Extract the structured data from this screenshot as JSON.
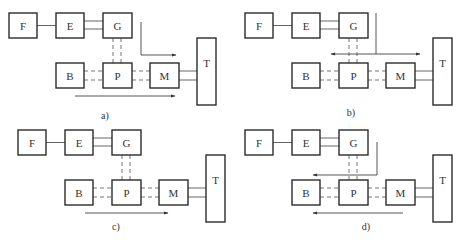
{
  "figure": {
    "colors": {
      "stroke": "#2b2b2b",
      "line": "#555555",
      "background": "#ffffff"
    },
    "components": [
      "F",
      "E",
      "G",
      "B",
      "P",
      "M",
      "T"
    ],
    "panels": [
      {
        "id": "a",
        "label": "a)",
        "offset": [
          0,
          0
        ],
        "label_pos": [
          105,
          119
        ],
        "flows": [
          {
            "points": [
              [
                141,
                22
              ],
              [
                141,
                55
              ],
              [
                176,
                55
              ]
            ],
            "heads": [
              "end"
            ]
          },
          {
            "points": [
              [
                75,
                96
              ],
              [
                175,
                96
              ]
            ],
            "heads": [
              "end"
            ]
          }
        ]
      },
      {
        "id": "b",
        "label": "b)",
        "offset": [
          236,
          0
        ],
        "label_pos": [
          351,
          116
        ],
        "flows": [
          {
            "points": [
              [
                376,
                13
              ],
              [
                376,
                54
              ]
            ],
            "heads": []
          },
          {
            "points": [
              [
                331,
                54
              ],
              [
                420,
                54
              ]
            ],
            "heads": [
              "start",
              "end"
            ]
          }
        ]
      },
      {
        "id": "c",
        "label": "c)",
        "offset": [
          9,
          117
        ],
        "label_pos": [
          116,
          230
        ],
        "flows": [
          {
            "points": [
              [
                85,
                213
              ],
              [
                168,
                213
              ]
            ],
            "heads": [
              "end"
            ]
          }
        ]
      },
      {
        "id": "d",
        "label": "d)",
        "offset": [
          236,
          117
        ],
        "label_pos": [
          366,
          230
        ],
        "flows": [
          {
            "points": [
              [
                377,
                142
              ],
              [
                377,
                175
              ],
              [
                313,
                175
              ]
            ],
            "heads": [
              "end"
            ]
          },
          {
            "points": [
              [
                403,
                213
              ],
              [
                313,
                213
              ]
            ],
            "heads": [
              "end"
            ]
          }
        ]
      }
    ],
    "layout_template": {
      "boxes": {
        "F": {
          "x": 9,
          "y": 13,
          "w": 28,
          "h": 25,
          "label": "F"
        },
        "E": {
          "x": 56,
          "y": 13,
          "w": 28,
          "h": 25,
          "label": "E"
        },
        "G": {
          "x": 103,
          "y": 13,
          "w": 29,
          "h": 25,
          "label": "G"
        },
        "B": {
          "x": 56,
          "y": 63,
          "w": 28,
          "h": 25,
          "label": "B"
        },
        "P": {
          "x": 103,
          "y": 63,
          "w": 29,
          "h": 25,
          "label": "P"
        },
        "M": {
          "x": 150,
          "y": 63,
          "w": 29,
          "h": 25,
          "label": "M"
        },
        "T": {
          "x": 197,
          "y": 38,
          "w": 19,
          "h": 67,
          "label": "T",
          "label_dy": -9
        }
      },
      "connections": [
        {
          "from": "F",
          "to": "E",
          "style": "solid",
          "kind": "single-h",
          "y": [
            25.5
          ]
        },
        {
          "from": "E",
          "to": "G",
          "style": "solid",
          "kind": "double-h",
          "y": [
            21,
            29
          ]
        },
        {
          "from": "G",
          "to": "P",
          "style": "dashed",
          "kind": "double-v",
          "x": [
            113,
            121
          ]
        },
        {
          "from": "B",
          "to": "P",
          "style": "dashed",
          "kind": "double-h",
          "y": [
            71,
            80
          ]
        },
        {
          "from": "P",
          "to": "M",
          "style": "dashed",
          "kind": "double-h",
          "y": [
            71,
            80
          ]
        },
        {
          "from": "M",
          "to": "T",
          "style": "solid",
          "kind": "double-h",
          "y": [
            71,
            80
          ]
        }
      ]
    }
  }
}
